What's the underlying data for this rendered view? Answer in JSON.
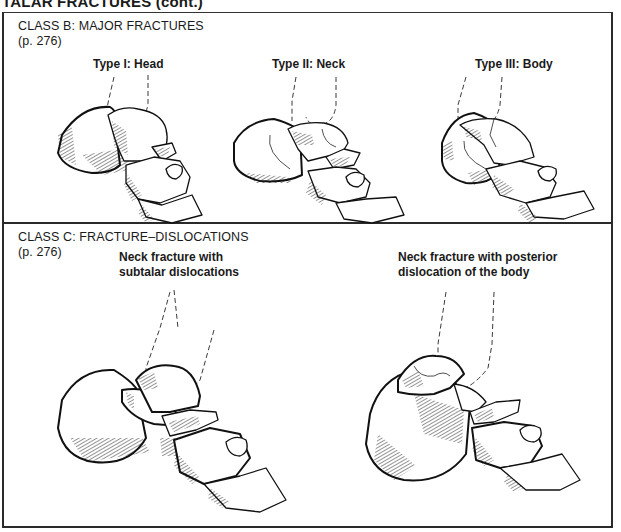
{
  "page": {
    "header": "TALAR FRACTURES (cont.)"
  },
  "panels": [
    {
      "id": "class-b",
      "title": "CLASS B: MAJOR FRACTURES",
      "page_ref": "(p. 276)",
      "figures": [
        {
          "caption": "Type I: Head",
          "icon": "talar-head-fracture-illustration"
        },
        {
          "caption": "Type II: Neck",
          "icon": "talar-neck-fracture-illustration"
        },
        {
          "caption": "Type III: Body",
          "icon": "talar-body-fracture-illustration"
        }
      ]
    },
    {
      "id": "class-c",
      "title": "CLASS C: FRACTURE–DISLOCATIONS",
      "page_ref": "(p. 276)",
      "figures": [
        {
          "caption_line1": "Neck fracture with",
          "caption_line2": "subtalar dislocations",
          "icon": "subtalar-dislocation-illustration"
        },
        {
          "caption_line1": "Neck fracture with posterior",
          "caption_line2": "dislocation of the body",
          "icon": "posterior-body-dislocation-illustration"
        }
      ]
    }
  ]
}
